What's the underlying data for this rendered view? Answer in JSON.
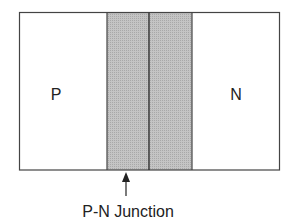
{
  "diagram": {
    "regions": [
      {
        "id": "p",
        "label": "P"
      },
      {
        "id": "n",
        "label": "N"
      }
    ],
    "junction_label": "P-N Junction",
    "colors": {
      "outline": "#444444",
      "depletion_fill": "#bdbdbd",
      "text": "#222222"
    }
  }
}
